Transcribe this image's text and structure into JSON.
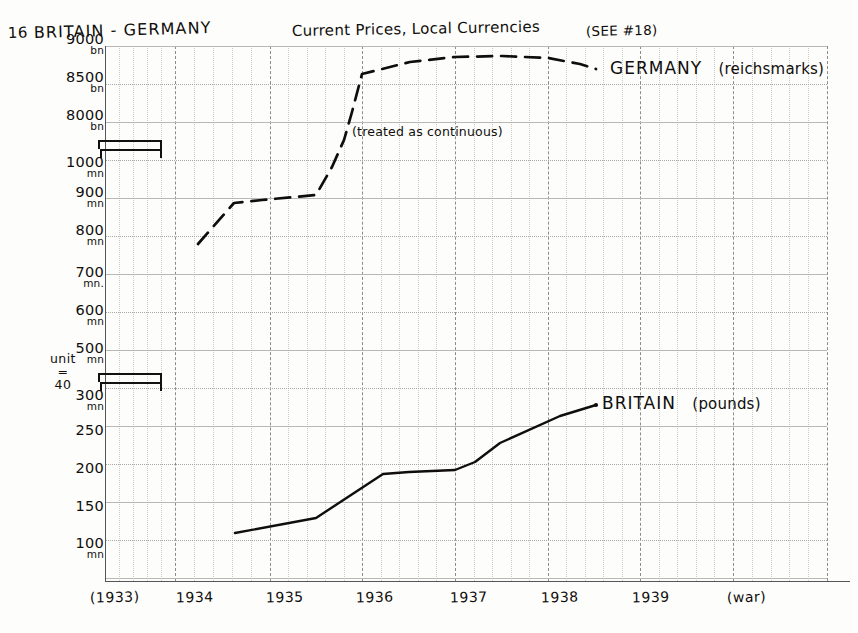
{
  "header": {
    "chart_number": "16",
    "title": "BRITAIN - GERMANY",
    "subtitle": "Current Prices, Local Currencies",
    "see_reference": "(SEE #18)"
  },
  "annotations": {
    "unit_note_line1": "unit",
    "unit_note_line2": "=",
    "unit_note_line3": "40",
    "continuous_note": "(treated as continuous)"
  },
  "chart_data": {
    "type": "line",
    "title": "16 BRITAIN - GERMANY",
    "subtitle": "Current Prices, Local Currencies (SEE #18)",
    "xlabel": "",
    "ylabel": "",
    "grid": true,
    "legend_position": "inline-right",
    "x_tick_labels": [
      "(1933)",
      "1934",
      "1935",
      "1936",
      "1937",
      "1938",
      "1939",
      "(war)"
    ],
    "x_values": [
      1933,
      1934,
      1935,
      1936,
      1937,
      1938,
      1939,
      1940
    ],
    "y_tick_labels": [
      {
        "value": "9000",
        "unit": "bn"
      },
      {
        "value": "8500",
        "unit": "bn"
      },
      {
        "value": "8000",
        "unit": "bn"
      },
      {
        "value": "1000",
        "unit": "mn"
      },
      {
        "value": "900",
        "unit": "mn"
      },
      {
        "value": "800",
        "unit": "mn"
      },
      {
        "value": "700",
        "unit": "mn."
      },
      {
        "value": "600",
        "unit": "mn"
      },
      {
        "value": "500",
        "unit": "mn"
      },
      {
        "value": "300",
        "unit": "mn"
      },
      {
        "value": "250",
        "unit": ""
      },
      {
        "value": "200",
        "unit": ""
      },
      {
        "value": "150",
        "unit": ""
      },
      {
        "value": "100",
        "unit": "mn"
      }
    ],
    "axis_breaks": 2,
    "series": [
      {
        "name": "GERMANY",
        "unit_label": "(reichsmarks)",
        "style": "dashed",
        "points": [
          {
            "x": 1933.3,
            "y_label": "~760 mn"
          },
          {
            "x": 1934.0,
            "y_label": "~895 mn"
          },
          {
            "x": 1935.5,
            "y_label": "~915 mn"
          },
          {
            "x": 1936.0,
            "y_label": "~8650 bn"
          },
          {
            "x": 1937.0,
            "y_label": "~8880 bn"
          },
          {
            "x": 1938.0,
            "y_label": "~8880 bn"
          },
          {
            "x": 1938.5,
            "y_label": "~8800 bn"
          }
        ]
      },
      {
        "name": "BRITAIN",
        "unit_label": "(pounds)",
        "style": "solid",
        "points": [
          {
            "x": 1933.6,
            "y_label": "116"
          },
          {
            "x": 1934.5,
            "y_label": "136"
          },
          {
            "x": 1935.5,
            "y_label": "192"
          },
          {
            "x": 1936.6,
            "y_label": "200"
          },
          {
            "x": 1937.5,
            "y_label": "245"
          },
          {
            "x": 1938.5,
            "y_label": "290"
          }
        ]
      }
    ]
  },
  "legend": {
    "germany": "GERMANY",
    "germany_unit": "(reichsmarks)",
    "britain": "BRITAIN",
    "britain_unit": "(pounds)"
  }
}
